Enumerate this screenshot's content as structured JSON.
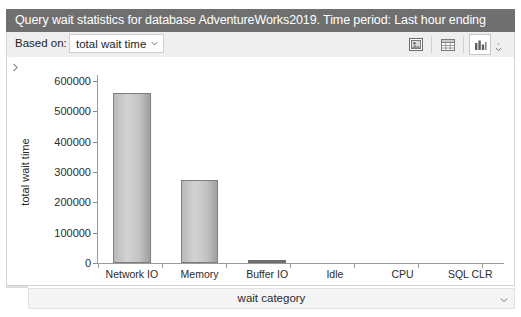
{
  "window": {
    "title": "Query wait statistics for database AdventureWorks2019. Time period: Last hour ending"
  },
  "toolbar": {
    "based_on_label": "Based on:",
    "based_on_value": "total wait time",
    "buttons": [
      {
        "name": "export-image-button",
        "icon": "picture-icon"
      },
      {
        "name": "grid-view-button",
        "icon": "table-icon"
      },
      {
        "name": "chart-view-button",
        "icon": "bar-chart-icon",
        "active": true
      }
    ],
    "overflow_label": "⋮"
  },
  "chart_data": {
    "type": "bar",
    "title": "Query wait statistics for database AdventureWorks2019. Time period: Last hour ending",
    "xlabel": "wait category",
    "ylabel": "total wait time",
    "categories": [
      "Network IO",
      "Memory",
      "Buffer IO",
      "Idle",
      "CPU",
      "SQL CLR"
    ],
    "values": [
      560000,
      274000,
      10000,
      0,
      0,
      0
    ],
    "yticks": [
      0,
      100000,
      200000,
      300000,
      400000,
      500000,
      600000
    ],
    "ytick_labels": [
      "0",
      "100000",
      "200000",
      "300000",
      "400000",
      "500000",
      "600000"
    ],
    "ylim": [
      0,
      620000
    ],
    "grid": false,
    "legend": false,
    "series": [
      {
        "name": "total wait time",
        "values": [
          560000,
          274000,
          10000,
          0,
          0,
          0
        ]
      }
    ]
  },
  "colors": {
    "title_bar": "#6f6f6f",
    "toolbar": "#efefef",
    "bar_fill": "#c3c3c3",
    "bar_border": "#7d7d7d",
    "axis": "#9a9a9a"
  },
  "icons": {
    "expander": "chevron-right-icon",
    "axis_menu": "chevron-down-icon",
    "select_caret": "chevron-down-icon"
  }
}
